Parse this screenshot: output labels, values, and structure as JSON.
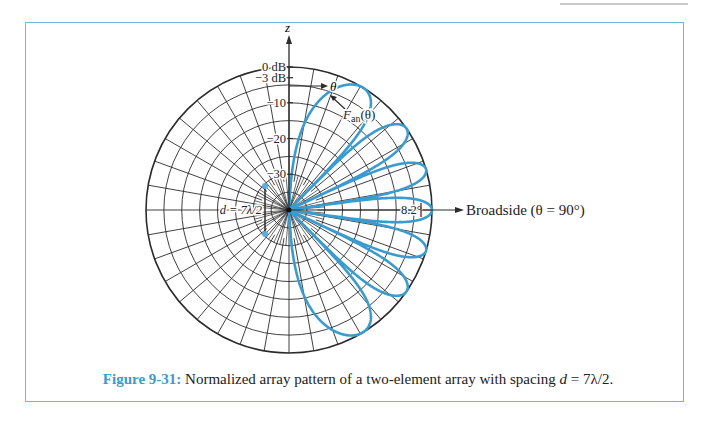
{
  "figure": {
    "label": "Figure 9-31:",
    "caption_text": "Normalized array pattern of a two-element array with spacing ",
    "caption_math_var": "d",
    "caption_math_rest": " = 7λ/2."
  },
  "plot": {
    "center": [
      289,
      210
    ],
    "radius": 143,
    "db_min": -40,
    "axis_label": "z",
    "ring_labels": [
      {
        "db": 0,
        "text": "0 dB"
      },
      {
        "db": -3,
        "text": "−3 dB"
      },
      {
        "db": -10,
        "text": "−10"
      },
      {
        "db": -20,
        "text": "−20"
      },
      {
        "db": -30,
        "text": "−30"
      }
    ],
    "theta_label": "θ",
    "pattern_label_main": "F",
    "pattern_label_sub": "an",
    "pattern_label_arg": "(θ)",
    "spacing_label": "d = 7λ/2",
    "beamwidth_label": "8.2°",
    "broadside_label": "Broadside  (θ = 90°)",
    "colors": {
      "pattern": "#3a9bcf",
      "grid": "#2b2b2b",
      "elements": "#5aaee0",
      "frame": "#6fb7d9"
    }
  },
  "chart_data": {
    "type": "polar",
    "title": "Normalized array pattern of a two-element array with spacing d = 7λ/2",
    "function": "F_an(θ) = cos²(π (d/λ) cos θ), d/λ = 3.5",
    "radial_scale": "dB",
    "radial_range_db": [
      -40,
      0
    ],
    "radial_ticks_db": [
      0,
      -3,
      -10,
      -20,
      -30
    ],
    "angular_grid_deg": 10,
    "lobe_count_half_plane": 7,
    "main_lobe_direction_deg": 90,
    "half_power_beamwidth_deg": 8.2,
    "lobe_peak_theta_deg": [
      0,
      16.6,
      34.8,
      55.2,
      73.4,
      90,
      106.6,
      124.8,
      145.2,
      163.4,
      180
    ],
    "annotations": [
      "Broadside (θ = 90°)",
      "d = 7λ/2",
      "8.2°",
      "F_an(θ)",
      "θ"
    ]
  }
}
